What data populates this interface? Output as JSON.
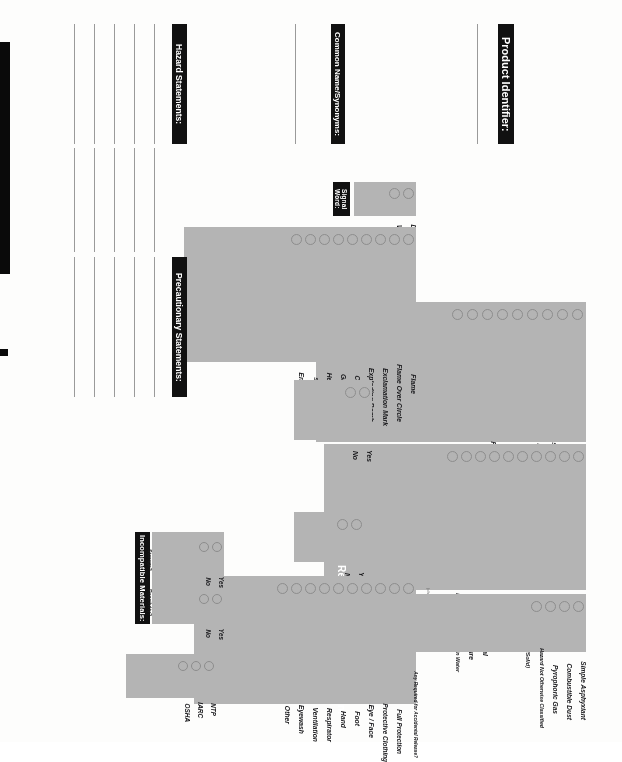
{
  "document": {
    "kind": "ghs-secondary-container-label-worksheet",
    "orientation_note": "scanned upside down"
  },
  "sections": {
    "health_hazards": {
      "title": "Health Hazards:",
      "note": "(check all that apply)",
      "items": [
        "Acute Toxicity",
        "Skin Corrosion / Irritation",
        "Serious Eye Damage / Irritation",
        "Respiratory / Skin Sensitization",
        "Germ Cell Mutagenicity",
        "Carcinogenicity",
        "Reproductive Toxicity",
        "Specific Target Organ Toxicity",
        "Aspiration Hazard"
      ]
    },
    "physical_hazards": {
      "title": "Physical Hazards:",
      "note": "(check all that apply)",
      "items": [
        "Explosive",
        "Flammable",
        "Oxidizer",
        "Self-Reactive",
        "Pyrophoric (Liquid/Solid)",
        "Self-Heating",
        "Organic Peroxide",
        "Corrosive to Metal",
        "Gas Under Pressure",
        "Emits Flammable Gas in Water"
      ]
    },
    "other": {
      "title": "Other:",
      "note": "(check all that apply)",
      "items": [
        "Simple Asphyxiant",
        "Combustible Dust",
        "Pyrophoric Gas",
        "Hazard Not Otherwise Classified"
      ]
    },
    "signal_word": {
      "title": "Signal Word:",
      "items": [
        "Danger",
        "Warning"
      ]
    },
    "hazard_symbol": {
      "title": "Hazard Symbol:",
      "items": [
        "Flame",
        "Flame Over Circle",
        "Exclamation Mark",
        "Exploding Bomb",
        "Corrosion",
        "Gas Cylinder",
        "Health Hazard",
        "Skull and Crossbones",
        "Environment"
      ]
    },
    "medical_attention": {
      "title": "Immediate medical attention / special treatment necessary?",
      "items": [
        "Yes",
        "No"
      ]
    },
    "fire_media": {
      "title": "Any unsuitable fire-extinguishing media?",
      "items": [
        "Yes",
        "No"
      ]
    },
    "personal_protection": {
      "title": "Required Personal Protection:",
      "note": "(check all that apply)",
      "items": [
        "Any Required for Accidental Release?",
        "Full Protection",
        "Protective Clothing",
        "Eye / Face",
        "Foot",
        "Hand",
        "Respirator",
        "Ventilation",
        "Eyewash",
        "Other"
      ]
    },
    "incompatible_materials": {
      "title": "Incompatible Materials:",
      "groups": [
        {
          "label": "Handling/ Storage?",
          "items": [
            "Yes",
            "No"
          ]
        },
        {
          "label": "Stability/ Reactivity?",
          "items": [
            "Yes",
            "No"
          ]
        }
      ]
    },
    "listed_carcinogen": {
      "title": "Listed as Carcinogen?",
      "note": "(check all that apply)",
      "items": [
        "NTP",
        "IARC",
        "OSHA"
      ]
    }
  },
  "fields": {
    "product_identifier": {
      "label": "Product Identifier:",
      "value": "",
      "lines": 1
    },
    "common_name": {
      "label": "Common Name/Synonyms:",
      "value": "",
      "lines": 1
    },
    "hazard_statements": {
      "label": "Hazard Statements:",
      "value": "",
      "lines": 5
    },
    "precautionary_statements": {
      "label": "Precautionary Statements:",
      "value": "",
      "lines": 5
    }
  },
  "colors": {
    "header_bar": "#111111",
    "header_text": "#ffffff",
    "stripe": "#b4b4b4",
    "page": "#ffffff",
    "rule": "#9a9a9a",
    "checkbox_border": "#8d8d8d"
  }
}
